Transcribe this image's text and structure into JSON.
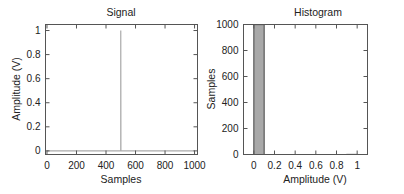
{
  "chart_data": [
    {
      "type": "line",
      "title": "Signal",
      "xlabel": "Samples",
      "ylabel": "Amplitude (V)",
      "xlim": [
        -10,
        1020
      ],
      "ylim": [
        -0.03,
        1.05
      ],
      "xticks": [
        0,
        200,
        400,
        600,
        800,
        1000
      ],
      "xtick_labels": [
        "0",
        "200",
        "400",
        "600",
        "800",
        "1000"
      ],
      "yticks": [
        0,
        0.2,
        0.4,
        0.6,
        0.8,
        1
      ],
      "ytick_labels": [
        "0",
        "0.2",
        "0.4",
        "0.6",
        "0.8",
        "1"
      ],
      "grid": false,
      "series": [
        {
          "name": "impulse",
          "color": "#aaaaaa",
          "x": [
            0,
            499,
            500,
            500,
            501,
            1000
          ],
          "y": [
            0,
            0,
            0,
            1,
            0,
            0
          ]
        }
      ]
    },
    {
      "type": "bar",
      "title": "Histogram",
      "xlabel": "Amplitude (V)",
      "ylabel": "Samples",
      "xlim": [
        -0.1,
        1.1
      ],
      "ylim": [
        0,
        1000
      ],
      "xticks": [
        0,
        0.2,
        0.4,
        0.6,
        0.8,
        1
      ],
      "xtick_labels": [
        "0",
        "0.2",
        "0.4",
        "0.6",
        "0.8",
        "1"
      ],
      "yticks": [
        0,
        200,
        400,
        600,
        800,
        1000
      ],
      "ytick_labels": [
        "0",
        "200",
        "400",
        "600",
        "800",
        "1000"
      ],
      "grid": false,
      "bins": [
        {
          "x0": 0.0,
          "x1": 0.1,
          "count": 999
        },
        {
          "x0": 0.9,
          "x1": 1.0,
          "count": 1
        }
      ],
      "bar_color": "#a9a9a9",
      "bar_edge_color": "#444444"
    }
  ],
  "labels": {
    "signal_title": "Signal",
    "signal_xlabel": "Samples",
    "signal_ylabel": "Amplitude (V)",
    "hist_title": "Histogram",
    "hist_xlabel": "Amplitude (V)",
    "hist_ylabel": "Samples"
  }
}
